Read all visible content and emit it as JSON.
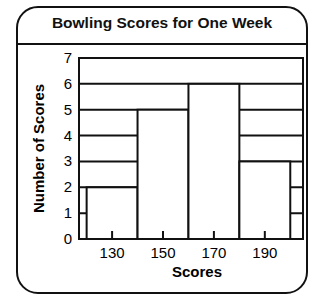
{
  "chart_data": {
    "type": "bar",
    "title": "Bowling Scores for One Week",
    "xlabel": "Scores",
    "ylabel": "Number of Scores",
    "bins": [
      [
        120,
        140
      ],
      [
        140,
        160
      ],
      [
        160,
        180
      ],
      [
        180,
        200
      ]
    ],
    "categories": [
      "130",
      "150",
      "170",
      "190"
    ],
    "values": [
      2,
      5,
      6,
      3
    ],
    "x_ticks": [
      "130",
      "150",
      "170",
      "190"
    ],
    "y_ticks": [
      "0",
      "1",
      "2",
      "3",
      "4",
      "5",
      "6",
      "7"
    ],
    "ylim": [
      0,
      7
    ],
    "grid": true,
    "legend": null
  }
}
